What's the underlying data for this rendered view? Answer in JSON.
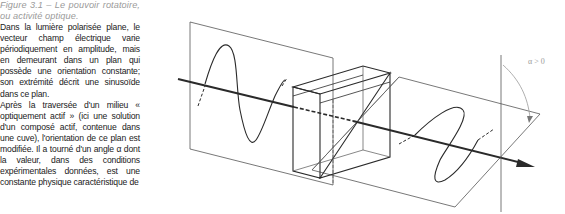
{
  "caption": {
    "label": "Figure 3.1",
    "text": "Figure 3.1 – Le pouvoir rotatoire, ou activité optique."
  },
  "body": {
    "paragraphs": [
      "Dans la lumière polarisée plane, le vecteur champ électrique varie périodiquement en amplitude, mais en demeurant dans un plan qui possède une orientation constante; son extrémité décrit une sinusoïde dans ce plan.",
      "Après la traversée d'un milieu « optiquement actif » (ici une solution d'un composé actif, contenue dans une cuve), l'orientation de ce plan est modifiée. Il a tourné d'un angle α dont la valeur, dans des conditions expérimentales données, est une constante physique caractéristique de"
    ]
  },
  "figure": {
    "angle_label": "α > 0",
    "elements": [
      "incident-polarization-plane",
      "incident-sine-wave",
      "sample-cuvette",
      "rotated-polarization-plane",
      "rotated-sine-wave",
      "propagation-axis-arrow",
      "vertical-reference-line",
      "rotation-angle-arc"
    ],
    "colors": {
      "line": "#2a2a2a",
      "thin_line": "#555555",
      "label": "#9a9a9a"
    }
  }
}
